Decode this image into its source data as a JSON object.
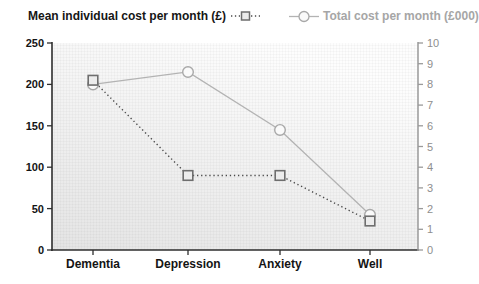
{
  "chart_data": {
    "type": "line",
    "title": "",
    "categories": [
      "Dementia",
      "Depression",
      "Anxiety",
      "Well"
    ],
    "series": [
      {
        "name": "Mean individual cost per month (£)",
        "axis": "left",
        "values": [
          205,
          90,
          90,
          35
        ],
        "line_style": "dotted",
        "marker": "square",
        "color": "#4a4a4a",
        "marker_fill": "#ececec",
        "marker_stroke": "#6e6e6e"
      },
      {
        "name": "Total cost per month (£000)",
        "axis": "right",
        "values": [
          8.0,
          8.6,
          5.8,
          1.7
        ],
        "line_style": "solid",
        "marker": "circle",
        "color": "#b3b3b3",
        "marker_fill": "#fafafa",
        "marker_stroke": "#a8a8a8"
      }
    ],
    "left_axis": {
      "min": 0,
      "max": 250,
      "step": 50,
      "ticks": [
        "0",
        "50",
        "100",
        "150",
        "200",
        "250"
      ]
    },
    "right_axis": {
      "min": 0,
      "max": 10,
      "step": 1,
      "ticks": [
        "0",
        "1",
        "2",
        "3",
        "4",
        "5",
        "6",
        "7",
        "8",
        "9",
        "10"
      ]
    },
    "legend_position": "top",
    "grid": "fine-paper-grid"
  },
  "colors": {
    "left_axis_text": "#141414",
    "right_axis_text": "#8e8e8e",
    "x_axis_text": "#141414",
    "axis_line": "#2e2e2e",
    "right_axis_line": "#9a9a9a",
    "plot_bg_top": "#fdfdfd",
    "plot_bg_bottom": "#e4e4e4",
    "grid_line": "#000000"
  }
}
